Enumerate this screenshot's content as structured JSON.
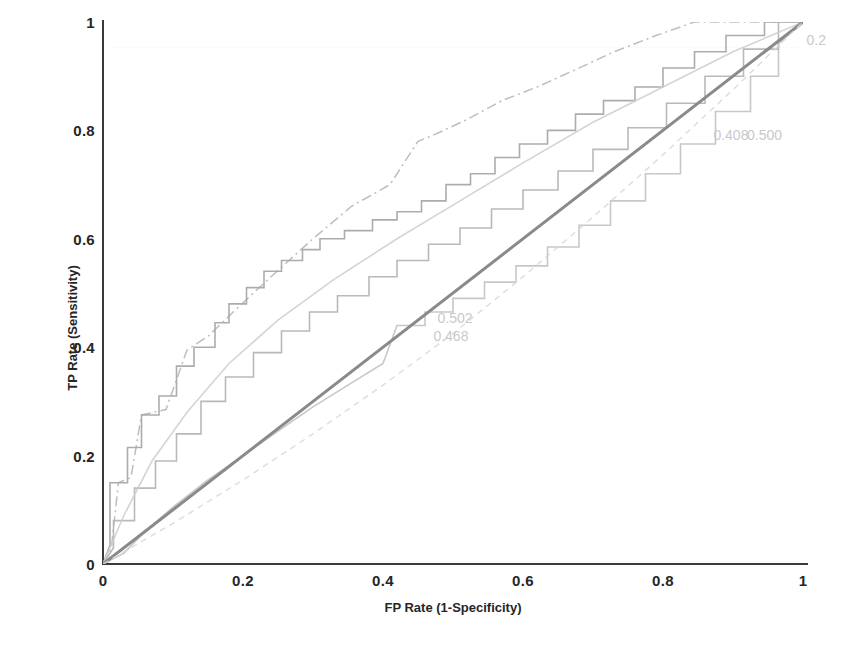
{
  "chart_data": {
    "type": "line",
    "title": "",
    "subtitle": "",
    "xlabel": "FP Rate (1-Specificity)",
    "ylabel": "TP Rate (Sensitivity)",
    "xlim": [
      0,
      1
    ],
    "ylim": [
      0,
      1
    ],
    "xticks": [
      "0",
      "0.2",
      "0.4",
      "0.6",
      "0.8",
      "1"
    ],
    "xtick_values": [
      0,
      0.2,
      0.4,
      0.6,
      0.8,
      1
    ],
    "yticks": [
      "0",
      "0.2",
      "0.4",
      "0.6",
      "0.8",
      "1"
    ],
    "ytick_values": [
      0,
      0.2,
      0.4,
      0.6,
      0.8,
      1
    ],
    "grid": false,
    "legend_position": "none",
    "annotations": [
      {
        "id": "ann-0502",
        "text": "0.502",
        "x": 0.478,
        "y": 0.452
      },
      {
        "id": "ann-0468",
        "text": "0.468",
        "x": 0.472,
        "y": 0.418
      },
      {
        "id": "ann-0408",
        "text": "0.408",
        "x": 0.872,
        "y": 0.79
      },
      {
        "id": "ann-0500",
        "text": "0.500",
        "x": 0.92,
        "y": 0.79
      },
      {
        "id": "ann-02x",
        "text": "0.2",
        "x": 1.005,
        "y": 0.965
      }
    ],
    "series": [
      {
        "name": "roc-upper-dashdot",
        "style": "dash-dot",
        "color": "#b9b9b9",
        "auc_label": "0.408",
        "points": [
          [
            0.0,
            0.0
          ],
          [
            0.012,
            0.03
          ],
          [
            0.022,
            0.15
          ],
          [
            0.04,
            0.16
          ],
          [
            0.055,
            0.275
          ],
          [
            0.09,
            0.285
          ],
          [
            0.12,
            0.395
          ],
          [
            0.15,
            0.42
          ],
          [
            0.19,
            0.47
          ],
          [
            0.24,
            0.53
          ],
          [
            0.3,
            0.6
          ],
          [
            0.355,
            0.66
          ],
          [
            0.41,
            0.7
          ],
          [
            0.45,
            0.78
          ],
          [
            0.47,
            0.79
          ],
          [
            0.52,
            0.82
          ],
          [
            0.57,
            0.855
          ],
          [
            0.62,
            0.88
          ],
          [
            0.68,
            0.915
          ],
          [
            0.73,
            0.945
          ],
          [
            0.79,
            0.975
          ],
          [
            0.845,
            1.0
          ],
          [
            1.0,
            1.0
          ]
        ]
      },
      {
        "name": "roc-step-a",
        "style": "step",
        "color": "#a8a8a8",
        "auc_label": "0.502",
        "points": [
          [
            0.0,
            0.0
          ],
          [
            0.01,
            0.035
          ],
          [
            0.01,
            0.15
          ],
          [
            0.035,
            0.15
          ],
          [
            0.035,
            0.215
          ],
          [
            0.055,
            0.215
          ],
          [
            0.055,
            0.275
          ],
          [
            0.08,
            0.275
          ],
          [
            0.08,
            0.31
          ],
          [
            0.105,
            0.31
          ],
          [
            0.105,
            0.365
          ],
          [
            0.13,
            0.365
          ],
          [
            0.13,
            0.4
          ],
          [
            0.16,
            0.4
          ],
          [
            0.16,
            0.445
          ],
          [
            0.18,
            0.445
          ],
          [
            0.18,
            0.48
          ],
          [
            0.205,
            0.48
          ],
          [
            0.205,
            0.51
          ],
          [
            0.23,
            0.51
          ],
          [
            0.23,
            0.54
          ],
          [
            0.255,
            0.54
          ],
          [
            0.255,
            0.56
          ],
          [
            0.285,
            0.56
          ],
          [
            0.285,
            0.58
          ],
          [
            0.31,
            0.58
          ],
          [
            0.31,
            0.6
          ],
          [
            0.345,
            0.6
          ],
          [
            0.345,
            0.615
          ],
          [
            0.385,
            0.615
          ],
          [
            0.385,
            0.635
          ],
          [
            0.42,
            0.635
          ],
          [
            0.42,
            0.65
          ],
          [
            0.455,
            0.65
          ],
          [
            0.455,
            0.67
          ],
          [
            0.49,
            0.67
          ],
          [
            0.49,
            0.7
          ],
          [
            0.525,
            0.7
          ],
          [
            0.525,
            0.72
          ],
          [
            0.56,
            0.72
          ],
          [
            0.56,
            0.75
          ],
          [
            0.595,
            0.75
          ],
          [
            0.595,
            0.775
          ],
          [
            0.635,
            0.775
          ],
          [
            0.635,
            0.8
          ],
          [
            0.675,
            0.8
          ],
          [
            0.675,
            0.83
          ],
          [
            0.715,
            0.83
          ],
          [
            0.715,
            0.855
          ],
          [
            0.76,
            0.855
          ],
          [
            0.76,
            0.88
          ],
          [
            0.8,
            0.88
          ],
          [
            0.8,
            0.915
          ],
          [
            0.845,
            0.915
          ],
          [
            0.845,
            0.945
          ],
          [
            0.89,
            0.945
          ],
          [
            0.89,
            0.975
          ],
          [
            0.945,
            0.975
          ],
          [
            0.945,
            1.0
          ],
          [
            1.0,
            1.0
          ]
        ]
      },
      {
        "name": "roc-step-b",
        "style": "step",
        "color": "#b5b5b5",
        "auc_label": "0.468",
        "points": [
          [
            0.0,
            0.0
          ],
          [
            0.015,
            0.03
          ],
          [
            0.015,
            0.08
          ],
          [
            0.045,
            0.08
          ],
          [
            0.045,
            0.14
          ],
          [
            0.075,
            0.14
          ],
          [
            0.075,
            0.19
          ],
          [
            0.105,
            0.19
          ],
          [
            0.105,
            0.24
          ],
          [
            0.14,
            0.24
          ],
          [
            0.14,
            0.3
          ],
          [
            0.175,
            0.3
          ],
          [
            0.175,
            0.345
          ],
          [
            0.215,
            0.345
          ],
          [
            0.215,
            0.39
          ],
          [
            0.255,
            0.39
          ],
          [
            0.255,
            0.43
          ],
          [
            0.295,
            0.43
          ],
          [
            0.295,
            0.465
          ],
          [
            0.335,
            0.465
          ],
          [
            0.335,
            0.495
          ],
          [
            0.38,
            0.495
          ],
          [
            0.38,
            0.53
          ],
          [
            0.42,
            0.53
          ],
          [
            0.42,
            0.56
          ],
          [
            0.465,
            0.56
          ],
          [
            0.465,
            0.59
          ],
          [
            0.51,
            0.59
          ],
          [
            0.51,
            0.62
          ],
          [
            0.555,
            0.62
          ],
          [
            0.555,
            0.655
          ],
          [
            0.6,
            0.655
          ],
          [
            0.6,
            0.69
          ],
          [
            0.65,
            0.69
          ],
          [
            0.65,
            0.725
          ],
          [
            0.7,
            0.725
          ],
          [
            0.7,
            0.765
          ],
          [
            0.75,
            0.765
          ],
          [
            0.75,
            0.805
          ],
          [
            0.805,
            0.805
          ],
          [
            0.805,
            0.85
          ],
          [
            0.86,
            0.85
          ],
          [
            0.86,
            0.9
          ],
          [
            0.915,
            0.9
          ],
          [
            0.915,
            0.95
          ],
          [
            0.965,
            0.95
          ],
          [
            0.965,
            1.0
          ],
          [
            1.0,
            1.0
          ]
        ]
      },
      {
        "name": "roc-step-lower",
        "style": "step",
        "color": "#c4c4c4",
        "auc_label": "0.2",
        "points": [
          [
            0.0,
            0.0
          ],
          [
            0.03,
            0.02
          ],
          [
            0.06,
            0.06
          ],
          [
            0.1,
            0.105
          ],
          [
            0.15,
            0.155
          ],
          [
            0.2,
            0.2
          ],
          [
            0.25,
            0.245
          ],
          [
            0.3,
            0.29
          ],
          [
            0.35,
            0.33
          ],
          [
            0.4,
            0.37
          ],
          [
            0.42,
            0.44
          ],
          [
            0.46,
            0.44
          ],
          [
            0.46,
            0.465
          ],
          [
            0.5,
            0.465
          ],
          [
            0.5,
            0.49
          ],
          [
            0.545,
            0.49
          ],
          [
            0.545,
            0.52
          ],
          [
            0.59,
            0.52
          ],
          [
            0.59,
            0.55
          ],
          [
            0.635,
            0.55
          ],
          [
            0.635,
            0.585
          ],
          [
            0.68,
            0.585
          ],
          [
            0.68,
            0.625
          ],
          [
            0.725,
            0.625
          ],
          [
            0.725,
            0.67
          ],
          [
            0.775,
            0.67
          ],
          [
            0.775,
            0.72
          ],
          [
            0.825,
            0.72
          ],
          [
            0.825,
            0.775
          ],
          [
            0.875,
            0.775
          ],
          [
            0.875,
            0.835
          ],
          [
            0.925,
            0.835
          ],
          [
            0.925,
            0.9
          ],
          [
            0.965,
            0.9
          ],
          [
            0.965,
            0.96
          ],
          [
            1.0,
            1.0
          ]
        ]
      },
      {
        "name": "roc-smooth-light",
        "style": "solid-light",
        "color": "#cfcfcf",
        "auc_label": "0.500",
        "points": [
          [
            0.0,
            0.0
          ],
          [
            0.03,
            0.09
          ],
          [
            0.07,
            0.19
          ],
          [
            0.12,
            0.28
          ],
          [
            0.18,
            0.37
          ],
          [
            0.25,
            0.45
          ],
          [
            0.33,
            0.525
          ],
          [
            0.42,
            0.6
          ],
          [
            0.51,
            0.67
          ],
          [
            0.6,
            0.74
          ],
          [
            0.7,
            0.815
          ],
          [
            0.8,
            0.88
          ],
          [
            0.9,
            0.945
          ],
          [
            1.0,
            1.0
          ]
        ]
      },
      {
        "name": "diagonal-reference",
        "style": "solid-dark",
        "color": "#8a8a8a",
        "auc_label": "0.500",
        "points": [
          [
            0.0,
            0.0
          ],
          [
            1.0,
            1.0
          ]
        ]
      },
      {
        "name": "roc-dashed-lower",
        "style": "dashed",
        "color": "#d8d8d8",
        "auc_label": "",
        "points": [
          [
            0.0,
            0.0
          ],
          [
            0.1,
            0.075
          ],
          [
            0.2,
            0.155
          ],
          [
            0.3,
            0.24
          ],
          [
            0.4,
            0.33
          ],
          [
            0.5,
            0.425
          ],
          [
            0.6,
            0.53
          ],
          [
            0.7,
            0.64
          ],
          [
            0.8,
            0.755
          ],
          [
            0.9,
            0.875
          ],
          [
            1.0,
            1.0
          ]
        ]
      }
    ]
  }
}
